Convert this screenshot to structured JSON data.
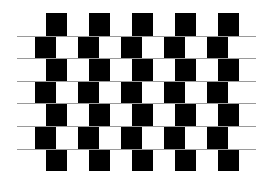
{
  "figure": {
    "name": "cafe-wall-illusion",
    "rows": 7,
    "tile_width": 21,
    "period": 43,
    "row_height": 22.6,
    "top": 13,
    "row_offsets": [
      46,
      35,
      46,
      35,
      46,
      35,
      46
    ],
    "tiles_per_row": [
      5,
      5,
      5,
      5,
      5,
      5,
      5
    ],
    "mortar_lines": {
      "count": 6,
      "x_start": 17,
      "x_end": 256
    },
    "colors": {
      "tile": "#000000",
      "background": "#ffffff",
      "mortar": "#9a9a9a"
    }
  }
}
